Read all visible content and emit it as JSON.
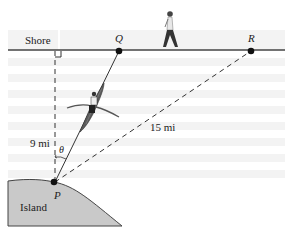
{
  "labels": {
    "shore": "Shore",
    "q": "Q",
    "r": "R",
    "p": "P",
    "island": "Island",
    "distance_pq_perp": "9 mi",
    "distance_pr": "15 mi",
    "angle": "θ"
  },
  "colors": {
    "island_fill": "#c9c9c9",
    "line": "#333333",
    "point": "#111111",
    "boat": "#555555",
    "stripe": "#f1f1f1"
  }
}
